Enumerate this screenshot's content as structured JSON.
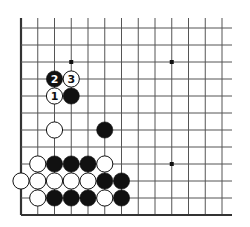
{
  "diagram": {
    "type": "go-board-fragment",
    "columns": 13,
    "rows": 12,
    "edges": {
      "left": true,
      "bottom": true,
      "top": false,
      "right": false
    },
    "star_points": [
      {
        "col": 4,
        "row": 10
      },
      {
        "col": 10,
        "row": 10
      },
      {
        "col": 10,
        "row": 4
      }
    ],
    "stones": [
      {
        "color": "black",
        "col": 3,
        "row": 9,
        "label": "2"
      },
      {
        "color": "white",
        "col": 4,
        "row": 9,
        "label": "3"
      },
      {
        "color": "white",
        "col": 3,
        "row": 8,
        "label": "1"
      },
      {
        "color": "black",
        "col": 4,
        "row": 8,
        "label": ""
      },
      {
        "color": "white",
        "col": 3,
        "row": 6,
        "label": ""
      },
      {
        "color": "black",
        "col": 6,
        "row": 6,
        "label": ""
      },
      {
        "color": "white",
        "col": 2,
        "row": 4,
        "label": ""
      },
      {
        "color": "black",
        "col": 3,
        "row": 4,
        "label": ""
      },
      {
        "color": "black",
        "col": 4,
        "row": 4,
        "label": ""
      },
      {
        "color": "black",
        "col": 5,
        "row": 4,
        "label": ""
      },
      {
        "color": "white",
        "col": 6,
        "row": 4,
        "label": ""
      },
      {
        "color": "white",
        "col": 1,
        "row": 3,
        "label": ""
      },
      {
        "color": "white",
        "col": 2,
        "row": 3,
        "label": ""
      },
      {
        "color": "white",
        "col": 3,
        "row": 3,
        "label": ""
      },
      {
        "color": "white",
        "col": 4,
        "row": 3,
        "label": ""
      },
      {
        "color": "white",
        "col": 5,
        "row": 3,
        "label": ""
      },
      {
        "color": "black",
        "col": 6,
        "row": 3,
        "label": ""
      },
      {
        "color": "black",
        "col": 7,
        "row": 3,
        "label": ""
      },
      {
        "color": "white",
        "col": 2,
        "row": 2,
        "label": ""
      },
      {
        "color": "black",
        "col": 3,
        "row": 2,
        "label": ""
      },
      {
        "color": "black",
        "col": 4,
        "row": 2,
        "label": ""
      },
      {
        "color": "black",
        "col": 5,
        "row": 2,
        "label": ""
      },
      {
        "color": "white",
        "col": 6,
        "row": 2,
        "label": ""
      },
      {
        "color": "black",
        "col": 7,
        "row": 2,
        "label": ""
      }
    ],
    "colors": {
      "line": "#555555",
      "edge": "#333333",
      "black": "#111111",
      "white": "#ffffff"
    }
  }
}
